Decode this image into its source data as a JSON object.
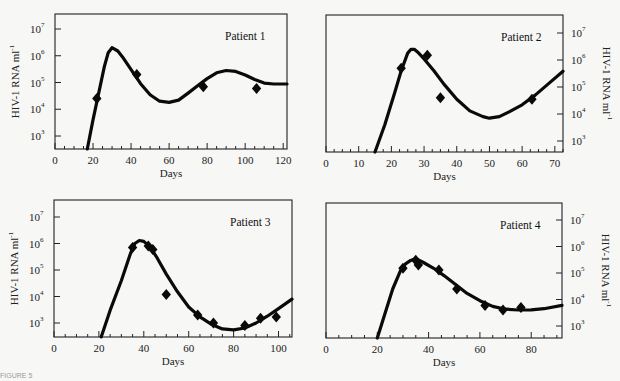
{
  "figure": {
    "caption_fragment": "FIGURE 5"
  },
  "chart_data": [
    {
      "type": "line",
      "title": "Patient 1",
      "xlabel": "Days",
      "ylabel": "HIV-1 RNA ml^-1",
      "yaxis_side": "left",
      "yscale": "log",
      "xlim": [
        0,
        122
      ],
      "ylim_log10": [
        2.45,
        7.55
      ],
      "xticks": [
        0,
        20,
        40,
        60,
        80,
        100,
        120
      ],
      "yticks": [
        "10^3",
        "10^4",
        "10^5",
        "10^6",
        "10^7"
      ],
      "grid": false,
      "series": [
        {
          "name": "Model fit",
          "kind": "line",
          "x": [
            17,
            20,
            23,
            26,
            28,
            30,
            33,
            36,
            40,
            45,
            50,
            55,
            60,
            65,
            70,
            75,
            80,
            85,
            90,
            95,
            100,
            105,
            110,
            115,
            122
          ],
          "y": [
            300,
            4000,
            40000,
            400000,
            1300000,
            2000000,
            1500000,
            800000,
            300000,
            90000,
            35000,
            20000,
            18000,
            22000,
            40000,
            75000,
            140000,
            230000,
            280000,
            260000,
            190000,
            130000,
            95000,
            88000,
            88000
          ]
        },
        {
          "name": "Measured",
          "kind": "scatter",
          "x": [
            22,
            43,
            78,
            106
          ],
          "y": [
            25000,
            200000,
            70000,
            60000
          ]
        }
      ]
    },
    {
      "type": "line",
      "title": "Patient 2",
      "xlabel": "Days",
      "ylabel": "HIV-1 RNA ml^-1",
      "yaxis_side": "right",
      "yscale": "log",
      "xlim": [
        0,
        72.5
      ],
      "ylim_log10": [
        2.45,
        7.6
      ],
      "xticks": [
        0,
        10,
        20,
        30,
        40,
        50,
        60,
        70
      ],
      "yticks": [
        "10^3",
        "10^4",
        "10^5",
        "10^6",
        "10^7"
      ],
      "grid": false,
      "series": [
        {
          "name": "Model fit",
          "kind": "line",
          "x": [
            15,
            18,
            21,
            23,
            25,
            26,
            27,
            28,
            30,
            33,
            36,
            40,
            44,
            48,
            50,
            53,
            56,
            60,
            64,
            68,
            72.5
          ],
          "y": [
            300,
            4000,
            60000,
            400000,
            1800000,
            2500000,
            2500000,
            2000000,
            1100000,
            400000,
            130000,
            35000,
            13000,
            8000,
            7000,
            8000,
            12000,
            22000,
            50000,
            130000,
            380000
          ]
        },
        {
          "name": "Measured",
          "kind": "scatter",
          "x": [
            23,
            31,
            35,
            63
          ],
          "y": [
            500000,
            1500000,
            40000,
            35000
          ]
        }
      ]
    },
    {
      "type": "line",
      "title": "Patient 3",
      "xlabel": "Days",
      "ylabel": "HIV-1 RNA ml^-1",
      "yaxis_side": "left",
      "yscale": "log",
      "xlim": [
        0,
        106
      ],
      "ylim_log10": [
        2.45,
        7.6
      ],
      "xticks": [
        0,
        20,
        40,
        60,
        80,
        100
      ],
      "yticks": [
        "10^3",
        "10^4",
        "10^5",
        "10^6",
        "10^7"
      ],
      "grid": false,
      "series": [
        {
          "name": "Model fit",
          "kind": "line",
          "x": [
            21,
            25,
            30,
            34,
            36,
            38,
            40,
            43,
            46,
            50,
            55,
            60,
            65,
            70,
            75,
            80,
            85,
            90,
            95,
            100,
            106
          ],
          "y": [
            300,
            3000,
            40000,
            400000,
            1000000,
            1300000,
            1200000,
            700000,
            280000,
            70000,
            15000,
            4000,
            1700,
            900,
            600,
            550,
            650,
            1000,
            1800,
            3500,
            8000
          ]
        },
        {
          "name": "Measured",
          "kind": "scatter",
          "x": [
            35,
            42,
            44,
            50,
            64,
            71,
            85,
            92,
            99
          ],
          "y": [
            700000,
            800000,
            600000,
            12000,
            2000,
            1000,
            800,
            1500,
            1700
          ]
        }
      ]
    },
    {
      "type": "line",
      "title": "Patient 4",
      "xlabel": "Days",
      "ylabel": "HIV-1 RNA ml^-1",
      "yaxis_side": "right",
      "yscale": "log",
      "xlim": [
        0,
        92
      ],
      "ylim_log10": [
        2.45,
        7.6
      ],
      "xticks": [
        0,
        20,
        40,
        60,
        80
      ],
      "yticks": [
        "10^3",
        "10^4",
        "10^5",
        "10^6",
        "10^7"
      ],
      "grid": false,
      "series": [
        {
          "name": "Model fit",
          "kind": "line",
          "x": [
            20,
            23,
            26,
            29,
            31,
            33,
            35,
            38,
            42,
            46,
            50,
            55,
            60,
            65,
            70,
            75,
            80,
            85,
            92
          ],
          "y": [
            300,
            3000,
            25000,
            120000,
            220000,
            300000,
            350000,
            250000,
            150000,
            80000,
            40000,
            17000,
            9000,
            5500,
            4300,
            4000,
            4100,
            4500,
            6000
          ]
        },
        {
          "name": "Measured",
          "kind": "scatter",
          "x": [
            30,
            35,
            36,
            44,
            51,
            62,
            69,
            76
          ],
          "y": [
            150000,
            300000,
            200000,
            130000,
            25000,
            6000,
            4000,
            5000
          ]
        }
      ]
    }
  ],
  "panels": [
    {
      "title": "Patient 1",
      "xlabel": "Days",
      "ylabel": "HIV-1 RNA ml",
      "ylabel_sup": "-1"
    },
    {
      "title": "Patient 2",
      "xlabel": "Days",
      "ylabel": "HIV-1 RNA ml",
      "ylabel_sup": "-1"
    },
    {
      "title": "Patient 3",
      "xlabel": "Days",
      "ylabel": "HIV-1 RNA ml",
      "ylabel_sup": "-1"
    },
    {
      "title": "Patient 4",
      "xlabel": "Days",
      "ylabel": "HIV-1 RNA ml",
      "ylabel_sup": "-1"
    }
  ]
}
